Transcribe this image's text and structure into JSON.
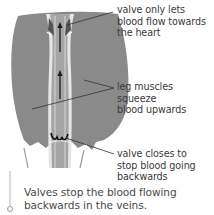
{
  "diagram": {
    "labels": [
      {
        "id": "top-valve",
        "text": "valve only lets blood flow towards the heart",
        "lines": [
          "valve only lets",
          "blood flow towards",
          "the heart"
        ]
      },
      {
        "id": "muscles",
        "text": "leg muscles squeeze blood upwards",
        "lines": [
          "leg muscles squeeze",
          "blood upwards"
        ]
      },
      {
        "id": "bottom-valve",
        "text": "valve closes to stop blood going backwards",
        "lines": [
          "valve closes to",
          "stop blood going",
          "backwards"
        ]
      }
    ],
    "caption": {
      "lines": [
        "Valves stop the blood flowing",
        "backwards in the veins."
      ]
    },
    "colors": {
      "leg": "#8a8a8a",
      "vein_outer": "#e8e8e8",
      "vein_inner": "#a9a9a9",
      "arrow": "#1a1a1a",
      "leader": "#333333",
      "caption_rule": "#b5b5b5"
    }
  }
}
